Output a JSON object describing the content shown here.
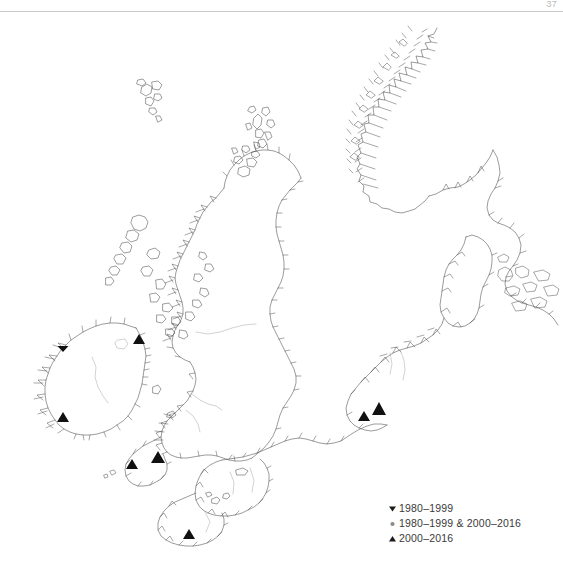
{
  "page": {
    "number": "37"
  },
  "legend": {
    "title": "Record periods",
    "items": [
      {
        "symbol": "down-triangle",
        "symbol_glyph": "▼",
        "label": "1980–1999",
        "color": "#111111"
      },
      {
        "symbol": "circle",
        "symbol_glyph": "●",
        "label": "1980–1999 & 2000–2016",
        "color": "#8a8a8a"
      },
      {
        "symbol": "up-triangle",
        "symbol_glyph": "▲",
        "label": "2000–2016",
        "color": "#111111"
      }
    ]
  },
  "map": {
    "style": {
      "coast_color": "#4a4a4a",
      "background": "#ffffff",
      "marker_color": "#111111"
    },
    "regions": [
      "Norway",
      "Sweden",
      "Denmark",
      "Germany",
      "Netherlands",
      "Belgium",
      "France",
      "Great Britain",
      "Ireland",
      "Faroe Islands",
      "Shetland Islands",
      "Orkney Islands",
      "Outer Hebrides"
    ],
    "records": [
      {
        "id": "rec-1",
        "type": "1980-1999",
        "symbol": "down-triangle",
        "x": 63,
        "y": 343,
        "size": 5.5,
        "area": "NW Ireland"
      },
      {
        "id": "rec-2",
        "type": "2000-2016",
        "symbol": "up-triangle",
        "x": 139,
        "y": 342,
        "size": 8.5,
        "area": "Irish Sea / NE Ireland"
      },
      {
        "id": "rec-3",
        "type": "2000-2016",
        "symbol": "up-triangle",
        "x": 63,
        "y": 420,
        "size": 8.5,
        "area": "SW Ireland"
      },
      {
        "id": "rec-4",
        "type": "2000-2016",
        "symbol": "up-triangle",
        "x": 132,
        "y": 467,
        "size": 8.5,
        "area": "Cornwall / Celtic Sea"
      },
      {
        "id": "rec-5",
        "type": "2000-2016",
        "symbol": "up-triangle",
        "x": 158,
        "y": 461,
        "size": 10,
        "area": "SW England"
      },
      {
        "id": "rec-6",
        "type": "2000-2016",
        "symbol": "up-triangle",
        "x": 364,
        "y": 419,
        "size": 9,
        "area": "Belgian coast"
      },
      {
        "id": "rec-7",
        "type": "2000-2016",
        "symbol": "up-triangle",
        "x": 379,
        "y": 413,
        "size": 11,
        "area": "Dutch coast"
      },
      {
        "id": "rec-8",
        "type": "2000-2016",
        "symbol": "up-triangle",
        "x": 189,
        "y": 537,
        "size": 9,
        "area": "Brittany"
      }
    ],
    "record_counts": {
      "1980-1999": 1,
      "1980-1999 & 2000-2016": 0,
      "2000-2016": 7,
      "total": 8
    }
  }
}
